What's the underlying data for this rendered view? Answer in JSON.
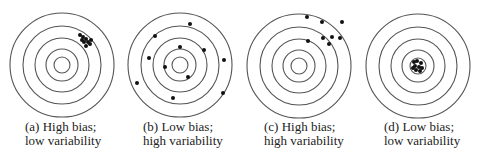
{
  "colors": {
    "ring": "#555555",
    "dot": "#111111",
    "text": "#222222",
    "background": "#ffffff"
  },
  "ring_radii": [
    52,
    39,
    27,
    16,
    8
  ],
  "panels": [
    {
      "id": "a",
      "caption_line1": "(a) High bias;",
      "caption_line2": "low variability",
      "center": [
        62,
        65
      ],
      "caption_pos": [
        25,
        120
      ],
      "dots": [
        [
          80,
          35
        ],
        [
          83,
          37
        ],
        [
          86,
          39
        ],
        [
          82,
          40
        ],
        [
          84,
          42
        ],
        [
          88,
          42
        ],
        [
          91,
          40
        ],
        [
          90,
          44
        ],
        [
          86,
          46
        ]
      ]
    },
    {
      "id": "b",
      "caption_line1": "(b) Low bias;",
      "caption_line2": "high variability",
      "center": [
        180,
        65
      ],
      "caption_pos": [
        143,
        120
      ],
      "dots": [
        [
          190,
          24
        ],
        [
          155,
          36
        ],
        [
          180,
          47
        ],
        [
          204,
          50
        ],
        [
          149,
          58
        ],
        [
          224,
          60
        ],
        [
          165,
          67
        ],
        [
          188,
          77
        ],
        [
          137,
          83
        ],
        [
          223,
          93
        ],
        [
          173,
          98
        ]
      ]
    },
    {
      "id": "c",
      "caption_line1": "(c) High bias;",
      "caption_line2": "high variability",
      "center": [
        299,
        66
      ],
      "caption_pos": [
        264,
        120
      ],
      "dots": [
        [
          307,
          17
        ],
        [
          322,
          22
        ],
        [
          342,
          22
        ],
        [
          323,
          38
        ],
        [
          332,
          37
        ],
        [
          340,
          38
        ],
        [
          308,
          41
        ],
        [
          329,
          44
        ]
      ]
    },
    {
      "id": "d",
      "caption_line1": "(d) Low bias;",
      "caption_line2": "low variability",
      "center": [
        418,
        66
      ],
      "caption_pos": [
        384,
        120
      ],
      "dots": [
        [
          414,
          62
        ],
        [
          417,
          61
        ],
        [
          421,
          63
        ],
        [
          415,
          66
        ],
        [
          419,
          67
        ],
        [
          422,
          68
        ],
        [
          416,
          70
        ],
        [
          420,
          71
        ],
        [
          413,
          68
        ]
      ]
    }
  ]
}
